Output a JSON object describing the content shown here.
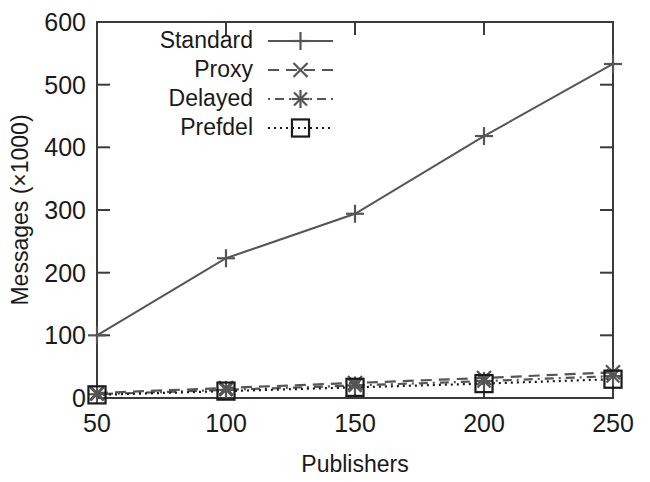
{
  "chart_data": {
    "type": "line",
    "title": "",
    "subtitle": "",
    "xlabel": "Publishers",
    "ylabel": "Messages (×1000)",
    "x": [
      50,
      100,
      150,
      200,
      250
    ],
    "xlim": [
      50,
      250
    ],
    "ylim": [
      0,
      600
    ],
    "xticks": [
      "50",
      "100",
      "150",
      "200",
      "250"
    ],
    "yticks": [
      "0",
      "100",
      "200",
      "300",
      "400",
      "500",
      "600"
    ],
    "grid": false,
    "legend_position": "top-center",
    "series": [
      {
        "name": "Standard",
        "values": [
          100,
          223,
          294,
          418,
          533
        ],
        "marker": "plus",
        "linestyle": "solid",
        "color": "#555555"
      },
      {
        "name": "Proxy",
        "values": [
          8,
          16,
          24,
          32,
          41
        ],
        "marker": "cross",
        "linestyle": "dashed",
        "color": "#555555"
      },
      {
        "name": "Delayed",
        "values": [
          6,
          13,
          20,
          27,
          35
        ],
        "marker": "asterisk",
        "linestyle": "dashdot",
        "color": "#555555"
      },
      {
        "name": "Prefdel",
        "values": [
          5,
          11,
          17,
          23,
          30
        ],
        "marker": "square",
        "linestyle": "dotted",
        "color": "#1a1a1a"
      }
    ]
  },
  "axes": {
    "x_tick_labels": [
      "50",
      "100",
      "150",
      "200",
      "250"
    ],
    "y_tick_labels": [
      "0",
      "100",
      "200",
      "300",
      "400",
      "500",
      "600"
    ],
    "x_axis_title": "Publishers",
    "y_axis_title": "Messages (×1000)"
  },
  "legend": {
    "entries": [
      {
        "label": "Standard",
        "icon": "plus-marker-icon"
      },
      {
        "label": "Proxy",
        "icon": "cross-marker-icon"
      },
      {
        "label": "Delayed",
        "icon": "asterisk-marker-icon"
      },
      {
        "label": "Prefdel",
        "icon": "square-marker-icon"
      }
    ]
  },
  "colors": {
    "line_gray": "#555555",
    "line_dark": "#1a1a1a",
    "frame": "#3b3b3b",
    "text": "#1a1a1a",
    "background": "#ffffff"
  }
}
